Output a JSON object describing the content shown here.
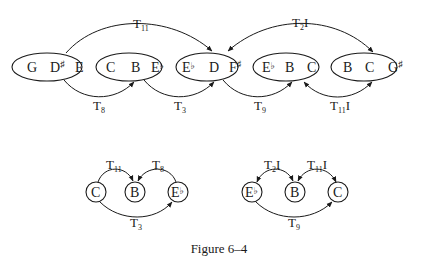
{
  "caption": "Figure 6–4",
  "top_row": {
    "sets": [
      {
        "id": "s1",
        "notes": [
          "G",
          "D",
          "E"
        ],
        "accidentals": [
          "",
          "♯",
          ""
        ]
      },
      {
        "id": "s2",
        "notes": [
          "C",
          "B",
          "E"
        ],
        "accidentals": [
          "",
          "",
          "♭"
        ]
      },
      {
        "id": "s3",
        "notes": [
          "E",
          "D",
          "F"
        ],
        "accidentals": [
          "♭",
          "",
          "♯"
        ]
      },
      {
        "id": "s4",
        "notes": [
          "E",
          "B",
          "C"
        ],
        "accidentals": [
          "♭",
          "",
          ""
        ]
      },
      {
        "id": "s5",
        "notes": [
          "B",
          "C",
          "G"
        ],
        "accidentals": [
          "",
          "",
          "♯"
        ]
      }
    ],
    "arrows": [
      {
        "from": "s1",
        "to": "s3",
        "label": "T",
        "sub": "11",
        "suffix": "",
        "position": "above"
      },
      {
        "from": "s5",
        "to": "s3",
        "label": "T",
        "sub": "2",
        "suffix": "I",
        "position": "above",
        "bidirectional": true
      },
      {
        "from": "s1",
        "to": "s2",
        "label": "T",
        "sub": "8",
        "suffix": "",
        "position": "below"
      },
      {
        "from": "s2",
        "to": "s3",
        "label": "T",
        "sub": "3",
        "suffix": "",
        "position": "below"
      },
      {
        "from": "s3",
        "to": "s4",
        "label": "T",
        "sub": "9",
        "suffix": "",
        "position": "below"
      },
      {
        "from": "s4",
        "to": "s5",
        "label": "T",
        "sub": "11",
        "suffix": "I",
        "position": "below",
        "bidirectional": true
      }
    ]
  },
  "bottom_left": {
    "nodes": [
      {
        "note": "C",
        "accidental": ""
      },
      {
        "note": "B",
        "accidental": ""
      },
      {
        "note": "E",
        "accidental": "♭"
      }
    ],
    "arrows": [
      {
        "from": "C",
        "to": "B",
        "label": "T",
        "sub": "11",
        "suffix": ""
      },
      {
        "from": "E♭",
        "to": "B",
        "label": "T",
        "sub": "8",
        "suffix": ""
      },
      {
        "from": "C",
        "to": "E♭",
        "label": "T",
        "sub": "3",
        "suffix": ""
      }
    ]
  },
  "bottom_right": {
    "nodes": [
      {
        "note": "E",
        "accidental": "♭"
      },
      {
        "note": "B",
        "accidental": ""
      },
      {
        "note": "C",
        "accidental": ""
      }
    ],
    "arrows": [
      {
        "from": "E♭",
        "to": "B",
        "label": "T",
        "sub": "2",
        "suffix": "I",
        "bidirectional": true
      },
      {
        "from": "B",
        "to": "C",
        "label": "T",
        "sub": "11",
        "suffix": "I",
        "bidirectional": true
      },
      {
        "from": "E♭",
        "to": "C",
        "label": "T",
        "sub": "9",
        "suffix": ""
      }
    ]
  }
}
